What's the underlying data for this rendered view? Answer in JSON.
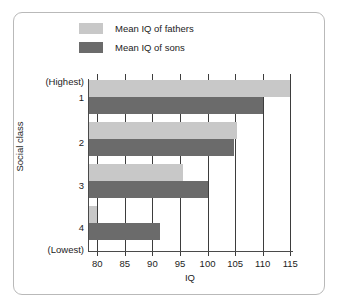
{
  "chart_data": {
    "type": "bar",
    "orientation": "horizontal",
    "title": "",
    "xlabel": "IQ",
    "ylabel": "Social class",
    "xlim": [
      78.5,
      115.5
    ],
    "xticks": [
      80,
      85,
      90,
      95,
      100,
      105,
      110,
      115
    ],
    "xtick_labels": [
      "80",
      "85",
      "90",
      "95",
      "100",
      "105",
      "110",
      "115"
    ],
    "grid": true,
    "grid_axis": "x",
    "categories": [
      "1",
      "2",
      "3",
      "4"
    ],
    "category_axis_labels": {
      "top": "(Highest)",
      "bottom": "(Lowest)"
    },
    "ytick_labels": [
      "(Highest)",
      "1",
      "2",
      "3",
      "4",
      "(Lowest)"
    ],
    "legend_position": "top-left",
    "series": [
      {
        "name": "Mean IQ of fathers",
        "color": "#c8c8c8",
        "values": [
          115.0,
          105.3,
          95.5,
          80.0
        ]
      },
      {
        "name": "Mean IQ of sons",
        "color": "#6b6b6b",
        "values": [
          110.0,
          104.8,
          100.0,
          91.3
        ]
      }
    ]
  },
  "legend": {
    "items": [
      {
        "label": "Mean IQ of fathers",
        "color": "#c8c8c8"
      },
      {
        "label": "Mean IQ of sons",
        "color": "#6b6b6b"
      }
    ]
  },
  "axes": {
    "x_title": "IQ",
    "y_title": "Social class",
    "x_ticks": [
      "80",
      "85",
      "90",
      "95",
      "100",
      "105",
      "110",
      "115"
    ],
    "y_ticks": [
      "(Highest)",
      "1",
      "2",
      "3",
      "4",
      "(Lowest)"
    ]
  },
  "colors": {
    "fathers": "#c8c8c8",
    "sons": "#6b6b6b",
    "axis": "#3d3d3d",
    "frame": "#b9b9b9",
    "background": "#ffffff"
  }
}
